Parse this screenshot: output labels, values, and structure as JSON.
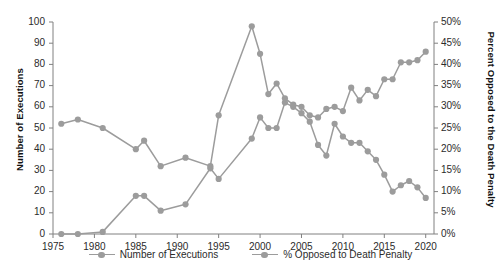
{
  "chart_data": {
    "type": "line",
    "title": "",
    "xlabel": "",
    "ylabel": "Number of Executions",
    "y2label": "Percent Opposed to the Death Penalty",
    "xlim": [
      1975,
      2021
    ],
    "ylim": [
      0,
      100
    ],
    "y2lim": [
      0,
      50
    ],
    "grid": false,
    "legend_position": "bottom",
    "x_ticks": [
      "1975",
      "1980",
      "1985",
      "1990",
      "1995",
      "2000",
      "2005",
      "2010",
      "2015",
      "2020"
    ],
    "y_ticks_left": [
      "0",
      "10",
      "20",
      "30",
      "40",
      "50",
      "60",
      "70",
      "80",
      "90",
      "100"
    ],
    "y_ticks_right": [
      "0%",
      "5%",
      "10%",
      "15%",
      "20%",
      "25%",
      "30%",
      "35%",
      "40%",
      "45%",
      "50%"
    ],
    "series": [
      {
        "name": "Number of Executions",
        "axis": "left",
        "color": "#9c9c9c",
        "points": [
          {
            "x": 1976,
            "y": 0
          },
          {
            "x": 1978,
            "y": 0
          },
          {
            "x": 1981,
            "y": 1
          },
          {
            "x": 1985,
            "y": 18
          },
          {
            "x": 1986,
            "y": 18
          },
          {
            "x": 1988,
            "y": 11
          },
          {
            "x": 1991,
            "y": 14
          },
          {
            "x": 1994,
            "y": 31
          },
          {
            "x": 1995,
            "y": 26
          },
          {
            "x": 1999,
            "y": 45
          },
          {
            "x": 2000,
            "y": 55
          },
          {
            "x": 2001,
            "y": 50
          },
          {
            "x": 2002,
            "y": 50
          },
          {
            "x": 2003,
            "y": 62
          },
          {
            "x": 2004,
            "y": 60
          },
          {
            "x": 2005,
            "y": 57
          },
          {
            "x": 2006,
            "y": 53
          },
          {
            "x": 2007,
            "y": 42
          },
          {
            "x": 2008,
            "y": 37
          },
          {
            "x": 2009,
            "y": 52
          },
          {
            "x": 2010,
            "y": 46
          },
          {
            "x": 2011,
            "y": 43
          },
          {
            "x": 2012,
            "y": 43
          },
          {
            "x": 2013,
            "y": 39
          },
          {
            "x": 2014,
            "y": 35
          },
          {
            "x": 2015,
            "y": 28
          },
          {
            "x": 2016,
            "y": 20
          },
          {
            "x": 2017,
            "y": 23
          },
          {
            "x": 2018,
            "y": 25
          },
          {
            "x": 2019,
            "y": 22
          },
          {
            "x": 2020,
            "y": 17
          }
        ]
      },
      {
        "name": "% Opposed to Death Penalty",
        "axis": "right",
        "color": "#9c9c9c",
        "points": [
          {
            "x": 1976,
            "y": 26
          },
          {
            "x": 1978,
            "y": 27
          },
          {
            "x": 1981,
            "y": 25
          },
          {
            "x": 1985,
            "y": 20
          },
          {
            "x": 1986,
            "y": 22
          },
          {
            "x": 1988,
            "y": 16
          },
          {
            "x": 1991,
            "y": 18
          },
          {
            "x": 1994,
            "y": 16
          },
          {
            "x": 1995,
            "y": 28
          },
          {
            "x": 1999,
            "y": 49
          },
          {
            "x": 2000,
            "y": 42.5
          },
          {
            "x": 2001,
            "y": 33
          },
          {
            "x": 2002,
            "y": 35.5
          },
          {
            "x": 2003,
            "y": 32
          },
          {
            "x": 2004,
            "y": 30.5
          },
          {
            "x": 2005,
            "y": 30
          },
          {
            "x": 2006,
            "y": 28
          },
          {
            "x": 2007,
            "y": 27.5
          },
          {
            "x": 2008,
            "y": 29.5
          },
          {
            "x": 2009,
            "y": 30
          },
          {
            "x": 2010,
            "y": 29
          },
          {
            "x": 2011,
            "y": 34.5
          },
          {
            "x": 2012,
            "y": 31.5
          },
          {
            "x": 2013,
            "y": 34
          },
          {
            "x": 2014,
            "y": 32.5
          },
          {
            "x": 2015,
            "y": 36.5
          },
          {
            "x": 2016,
            "y": 36.5
          },
          {
            "x": 2017,
            "y": 40.5
          },
          {
            "x": 2018,
            "y": 40.5
          },
          {
            "x": 2019,
            "y": 41
          },
          {
            "x": 2020,
            "y": 43
          }
        ]
      }
    ],
    "legend": [
      {
        "label": "Number of Executions"
      },
      {
        "label": "% Opposed to Death Penalty"
      }
    ]
  }
}
